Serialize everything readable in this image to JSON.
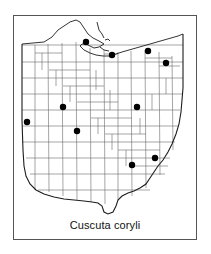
{
  "figure": {
    "kind": "species-distribution-map",
    "region": "Ohio",
    "caption": "Cuscuta coryli",
    "frame": {
      "x": 13,
      "y": 15,
      "width": 184,
      "height": 225,
      "border_color": "#555555"
    },
    "background_color": "#ffffff"
  },
  "map": {
    "state_outline_color": "#222222",
    "county_line_color": "#666666",
    "lake_label": "",
    "dot_color": "#000000",
    "dot_radius": 3.2
  },
  "chart_data": {
    "type": "scatter",
    "title": "Cuscuta coryli",
    "xlabel": "",
    "ylabel": "",
    "grid": false,
    "legend": "none",
    "units": "county occurrence records",
    "point_count": 11,
    "points": [
      {
        "id": "p1",
        "x": 86,
        "y": 42,
        "label": ""
      },
      {
        "id": "p2",
        "x": 112,
        "y": 55,
        "label": ""
      },
      {
        "id": "p3",
        "x": 148,
        "y": 51,
        "label": ""
      },
      {
        "id": "p4",
        "x": 166,
        "y": 63,
        "label": ""
      },
      {
        "id": "p5",
        "x": 27,
        "y": 122,
        "label": ""
      },
      {
        "id": "p6",
        "x": 63,
        "y": 107,
        "label": ""
      },
      {
        "id": "p7",
        "x": 77,
        "y": 131,
        "label": ""
      },
      {
        "id": "p8",
        "x": 137,
        "y": 107,
        "label": ""
      },
      {
        "id": "p9",
        "x": 132,
        "y": 165,
        "label": ""
      },
      {
        "id": "p10",
        "x": 155,
        "y": 158,
        "label": ""
      },
      {
        "id": "p11",
        "x": 113,
        "y": 56,
        "label": ""
      }
    ]
  }
}
